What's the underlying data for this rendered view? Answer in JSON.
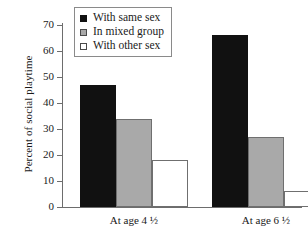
{
  "chart_data": {
    "type": "bar",
    "title": "",
    "xlabel": "",
    "ylabel": "Percent of social playtime",
    "categories": [
      "At age 4 ½",
      "At age 6 ½"
    ],
    "series": [
      {
        "name": "With same sex",
        "values": [
          47,
          66
        ],
        "color": "#111111"
      },
      {
        "name": "In mixed group",
        "values": [
          34,
          27
        ],
        "color": "#a9a9a9"
      },
      {
        "name": "With other sex",
        "values": [
          18,
          6
        ],
        "color": "#ffffff"
      }
    ],
    "ylim": [
      0,
      70
    ],
    "yticks": [
      0,
      10,
      20,
      30,
      40,
      50,
      60,
      70
    ],
    "ytick_labels": [
      "0",
      "10",
      "20",
      "30",
      "40",
      "50",
      "60",
      "70"
    ],
    "grid": false,
    "legend_position": "top-center"
  },
  "legend": {
    "items": [
      {
        "label": "With same sex",
        "swatch": "filled-black-square"
      },
      {
        "label": "In mixed group",
        "swatch": "filled-gray-square"
      },
      {
        "label": "With other sex",
        "swatch": "open-white-square"
      }
    ]
  }
}
